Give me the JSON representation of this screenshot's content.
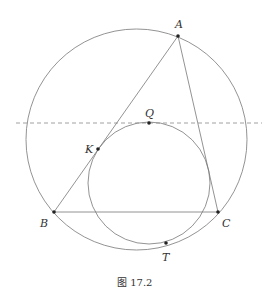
{
  "figure": {
    "caption": "图 17.2",
    "points": {
      "A": {
        "label": "A",
        "x": 178,
        "y": 36
      },
      "B": {
        "label": "B",
        "x": 54,
        "y": 212
      },
      "C": {
        "label": "C",
        "x": 218,
        "y": 212
      },
      "K": {
        "label": "K",
        "x": 98,
        "y": 149
      },
      "Q": {
        "label": "Q",
        "x": 149,
        "y": 123
      },
      "T": {
        "label": "T",
        "x": 166,
        "y": 243
      }
    },
    "circles": [
      {
        "name": "circumcircle",
        "cx": 136.5,
        "cy": 139.5,
        "r": 110.5
      },
      {
        "name": "mixtilinear-circle",
        "cx": 149,
        "cy": 183,
        "r": 61
      }
    ],
    "dashed_line_y": 123,
    "colors": {
      "stroke": "#777777",
      "point": "#222222",
      "text": "#333333"
    }
  }
}
